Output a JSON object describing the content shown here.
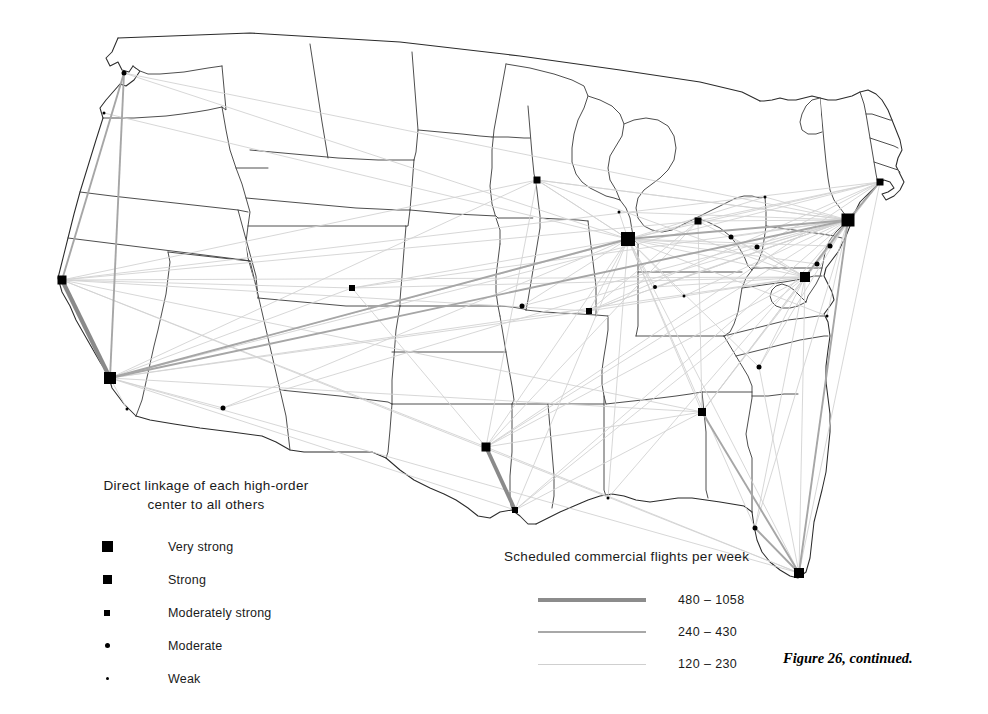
{
  "figure": {
    "caption": "Figure 26, continued.",
    "background_color": "#ffffff",
    "outline_color": "#3a3a3a"
  },
  "linkage_legend": {
    "title": "Direct linkage of each high-order center to all others",
    "title_line1": "Direct linkage of each high-order",
    "title_line2": "center to all others",
    "classes": [
      {
        "label": "Very strong",
        "shape": "square",
        "size": 11,
        "color": "#000000"
      },
      {
        "label": "Strong",
        "shape": "square",
        "size": 9,
        "color": "#000000"
      },
      {
        "label": "Moderately strong",
        "shape": "square",
        "size": 6,
        "color": "#000000"
      },
      {
        "label": "Moderate",
        "shape": "circle",
        "size": 5,
        "color": "#000000"
      },
      {
        "label": "Weak",
        "shape": "circle",
        "size": 3,
        "color": "#000000"
      }
    ]
  },
  "flights_legend": {
    "title": "Scheduled commercial flights per week",
    "classes": [
      {
        "label": "480 – 1058",
        "width": 3.6,
        "color": "#8c8c8c"
      },
      {
        "label": "240 – 430",
        "width": 2.0,
        "color": "#a8a8a8"
      },
      {
        "label": "120 – 230",
        "width": 1.0,
        "color": "#cfcfcf"
      }
    ]
  },
  "chart_data": {
    "type": "map",
    "title": "Direct linkage of each high-order center to all others",
    "subtitle": "Scheduled commercial flights per week",
    "projection": "conterminous United States, state outlines",
    "cities": [
      {
        "name": "Seattle",
        "x": 124,
        "y": 73,
        "linkage": "Moderate",
        "shape": "circle",
        "size": 5
      },
      {
        "name": "Portland",
        "x": 104,
        "y": 113,
        "linkage": "Weak",
        "shape": "circle",
        "size": 3
      },
      {
        "name": "San Francisco",
        "x": 62,
        "y": 280,
        "linkage": "Strong",
        "shape": "square",
        "size": 9
      },
      {
        "name": "Los Angeles",
        "x": 110,
        "y": 378,
        "linkage": "Very strong",
        "shape": "square",
        "size": 12
      },
      {
        "name": "San Diego",
        "x": 127,
        "y": 409,
        "linkage": "Weak",
        "shape": "circle",
        "size": 3
      },
      {
        "name": "Phoenix",
        "x": 223,
        "y": 408,
        "linkage": "Moderate",
        "shape": "circle",
        "size": 5
      },
      {
        "name": "Denver",
        "x": 352,
        "y": 288,
        "linkage": "Moderately strong",
        "shape": "square",
        "size": 6
      },
      {
        "name": "Minneapolis",
        "x": 537,
        "y": 180,
        "linkage": "Moderately strong",
        "shape": "square",
        "size": 7
      },
      {
        "name": "Kansas City",
        "x": 522,
        "y": 306,
        "linkage": "Moderate",
        "shape": "circle",
        "size": 5
      },
      {
        "name": "St. Louis",
        "x": 589,
        "y": 311,
        "linkage": "Moderately strong",
        "shape": "square",
        "size": 6
      },
      {
        "name": "Chicago",
        "x": 628,
        "y": 239,
        "linkage": "Very strong",
        "shape": "square",
        "size": 14
      },
      {
        "name": "Milwaukee",
        "x": 619,
        "y": 212,
        "linkage": "Weak",
        "shape": "circle",
        "size": 3
      },
      {
        "name": "Detroit",
        "x": 698,
        "y": 221,
        "linkage": "Moderately strong",
        "shape": "square",
        "size": 7
      },
      {
        "name": "Cleveland",
        "x": 731,
        "y": 237,
        "linkage": "Moderate",
        "shape": "circle",
        "size": 5
      },
      {
        "name": "Indianapolis",
        "x": 655,
        "y": 287,
        "linkage": "Moderate",
        "shape": "circle",
        "size": 4
      },
      {
        "name": "Cincinnati",
        "x": 684,
        "y": 296,
        "linkage": "Weak",
        "shape": "circle",
        "size": 3
      },
      {
        "name": "Pittsburgh",
        "x": 757,
        "y": 247,
        "linkage": "Moderate",
        "shape": "circle",
        "size": 5
      },
      {
        "name": "Buffalo",
        "x": 765,
        "y": 197,
        "linkage": "Weak",
        "shape": "circle",
        "size": 3
      },
      {
        "name": "New York",
        "x": 848,
        "y": 220,
        "linkage": "Very strong",
        "shape": "square",
        "size": 13
      },
      {
        "name": "Boston",
        "x": 880,
        "y": 182,
        "linkage": "Moderately strong",
        "shape": "square",
        "size": 7
      },
      {
        "name": "Philadelphia",
        "x": 830,
        "y": 246,
        "linkage": "Moderate",
        "shape": "circle",
        "size": 5
      },
      {
        "name": "Baltimore",
        "x": 817,
        "y": 264,
        "linkage": "Moderate",
        "shape": "circle",
        "size": 5
      },
      {
        "name": "Washington",
        "x": 805,
        "y": 277,
        "linkage": "Strong",
        "shape": "square",
        "size": 10
      },
      {
        "name": "Norfolk",
        "x": 827,
        "y": 316,
        "linkage": "Weak",
        "shape": "circle",
        "size": 3
      },
      {
        "name": "Charlotte",
        "x": 759,
        "y": 367,
        "linkage": "Moderate",
        "shape": "circle",
        "size": 5
      },
      {
        "name": "Atlanta",
        "x": 702,
        "y": 412,
        "linkage": "Moderately strong",
        "shape": "square",
        "size": 8
      },
      {
        "name": "New Orleans",
        "x": 608,
        "y": 498,
        "linkage": "Weak",
        "shape": "circle",
        "size": 3
      },
      {
        "name": "Dallas",
        "x": 486,
        "y": 447,
        "linkage": "Strong",
        "shape": "square",
        "size": 9
      },
      {
        "name": "Houston",
        "x": 515,
        "y": 510,
        "linkage": "Moderately strong",
        "shape": "square",
        "size": 6
      },
      {
        "name": "Tampa",
        "x": 755,
        "y": 528,
        "linkage": "Moderate",
        "shape": "circle",
        "size": 5
      },
      {
        "name": "Miami",
        "x": 799,
        "y": 573,
        "linkage": "Strong",
        "shape": "square",
        "size": 10
      }
    ],
    "links": [
      {
        "from": "San Francisco",
        "to": "Los Angeles",
        "class": "480 – 1058",
        "width": 4.2,
        "color": "#8a8a8a"
      },
      {
        "from": "Dallas",
        "to": "Houston",
        "class": "480 – 1058",
        "width": 3.8,
        "color": "#8a8a8a"
      },
      {
        "from": "Seattle",
        "to": "San Francisco",
        "class": "240 – 430",
        "width": 1.9,
        "color": "#a9a9a9"
      },
      {
        "from": "Seattle",
        "to": "Los Angeles",
        "class": "240 – 430",
        "width": 1.9,
        "color": "#a9a9a9"
      },
      {
        "from": "Portland",
        "to": "Los Angeles",
        "class": "120 – 230",
        "width": 1.0,
        "color": "#cccccc"
      },
      {
        "from": "Portland",
        "to": "San Francisco",
        "class": "120 – 230",
        "width": 1.0,
        "color": "#cccccc"
      },
      {
        "from": "New York",
        "to": "Chicago",
        "class": "480 – 1058",
        "width": 2.1,
        "color": "#9a9a9a"
      },
      {
        "from": "New York",
        "to": "Washington",
        "class": "480 – 1058",
        "width": 2.2,
        "color": "#9a9a9a"
      },
      {
        "from": "New York",
        "to": "Boston",
        "class": "480 – 1058",
        "width": 2.0,
        "color": "#9a9a9a"
      },
      {
        "from": "New York",
        "to": "Miami",
        "class": "240 – 430",
        "width": 1.5,
        "color": "#a9a9a9"
      },
      {
        "from": "New York",
        "to": "Los Angeles",
        "class": "240 – 430",
        "width": 1.3,
        "color": "#b4b4b4"
      },
      {
        "from": "Chicago",
        "to": "Los Angeles",
        "class": "240 – 430",
        "width": 1.3,
        "color": "#b4b4b4"
      },
      {
        "from": "Miami",
        "to": "Atlanta",
        "class": "240 – 430",
        "width": 1.5,
        "color": "#a9a9a9"
      },
      {
        "from": "Miami",
        "to": "Tampa",
        "class": "240 – 430",
        "width": 1.4,
        "color": "#a9a9a9"
      },
      {
        "from": "Miami",
        "to": "Washington",
        "class": "120 – 230",
        "width": 1.1,
        "color": "#bcbcbc"
      }
    ]
  }
}
